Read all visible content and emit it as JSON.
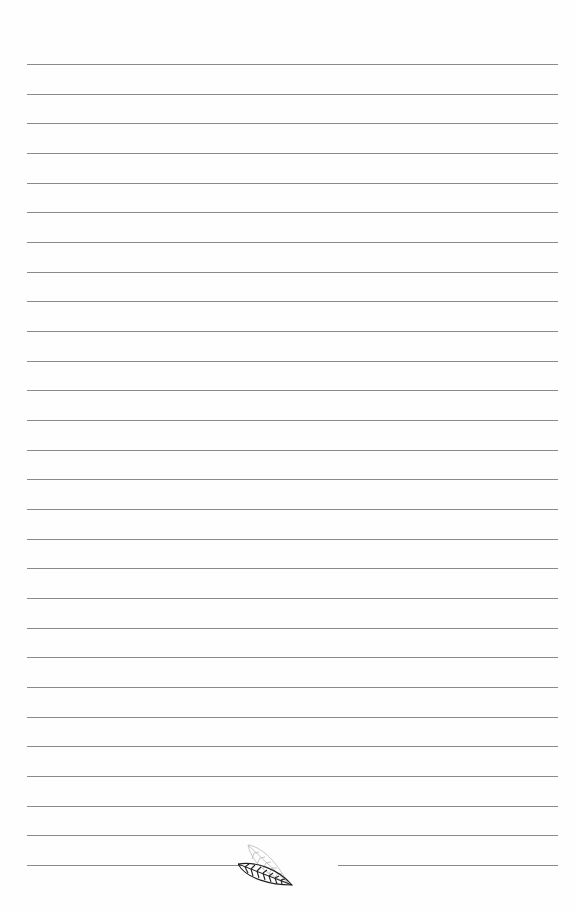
{
  "page": {
    "type": "lined-notebook-page",
    "background_color": "#ffffff",
    "line_color": "#8a8a8a",
    "line_count_full": 27,
    "line_start_y": 64,
    "line_spacing": 29.67,
    "line_left_x": 27,
    "line_right_x": 558,
    "bottom_split_line": {
      "y": 865,
      "left_segment": [
        27,
        242
      ],
      "right_segment": [
        338,
        558
      ]
    },
    "ornament": {
      "icon": "leaf-pair-icon",
      "front_leaf_color": "#222222",
      "back_leaf_color": "#b8b8b8"
    }
  }
}
